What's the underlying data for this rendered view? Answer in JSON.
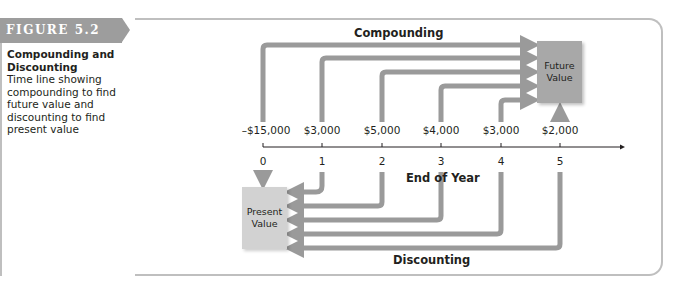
{
  "figure": {
    "tag": "FIGURE 5.2",
    "title": "Compounding and Discounting",
    "description": "Time line showing compounding to find future value and discounting to find present value"
  },
  "diagram": {
    "compounding_label": "Compounding",
    "discounting_label": "Discounting",
    "axis_label": "End of Year",
    "future_value_box": "Future Value",
    "present_value_box": "Present Value",
    "colors": {
      "arrow": "#9a9a9a",
      "future_box": "#a8a8a8",
      "present_box": "#d2d2d2",
      "tag": "#9d9d9d",
      "frame": "#bfbfbf"
    },
    "timeline": [
      {
        "year": "0",
        "cash_flow": "–$15,000"
      },
      {
        "year": "1",
        "cash_flow": "$3,000"
      },
      {
        "year": "2",
        "cash_flow": "$5,000"
      },
      {
        "year": "3",
        "cash_flow": "$4,000"
      },
      {
        "year": "4",
        "cash_flow": "$3,000"
      },
      {
        "year": "5",
        "cash_flow": "$2,000"
      }
    ]
  }
}
